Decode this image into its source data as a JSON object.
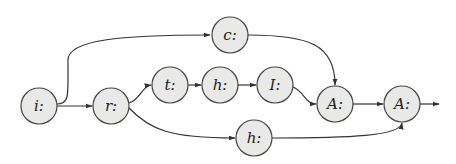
{
  "diagram": {
    "type": "directed-graph",
    "style": {
      "node_fill": "#e9e9e7",
      "node_stroke": "#444444",
      "edge_color": "#333333",
      "background": "#ffffff"
    },
    "nodes": [
      {
        "id": "i",
        "label": "i:",
        "x": 39,
        "y": 106
      },
      {
        "id": "r",
        "label": "r:",
        "x": 111,
        "y": 106
      },
      {
        "id": "c",
        "label": "c:",
        "x": 230,
        "y": 35
      },
      {
        "id": "t",
        "label": "t:",
        "x": 170,
        "y": 85
      },
      {
        "id": "h1",
        "label": "h:",
        "x": 220,
        "y": 85
      },
      {
        "id": "I",
        "label": "I:",
        "x": 275,
        "y": 85
      },
      {
        "id": "A1",
        "label": "A:",
        "x": 335,
        "y": 104
      },
      {
        "id": "A2",
        "label": "A:",
        "x": 402,
        "y": 104
      },
      {
        "id": "h2",
        "label": "h:",
        "x": 254,
        "y": 138
      }
    ],
    "edges": [
      {
        "from": "i",
        "to": "c"
      },
      {
        "from": "i",
        "to": "r"
      },
      {
        "from": "r",
        "to": "t"
      },
      {
        "from": "r",
        "to": "h2"
      },
      {
        "from": "t",
        "to": "h1"
      },
      {
        "from": "h1",
        "to": "I"
      },
      {
        "from": "I",
        "to": "A1"
      },
      {
        "from": "c",
        "to": "A1"
      },
      {
        "from": "A1",
        "to": "A2"
      },
      {
        "from": "h2",
        "to": "A2"
      },
      {
        "from": "A2",
        "to": "exit"
      }
    ]
  }
}
